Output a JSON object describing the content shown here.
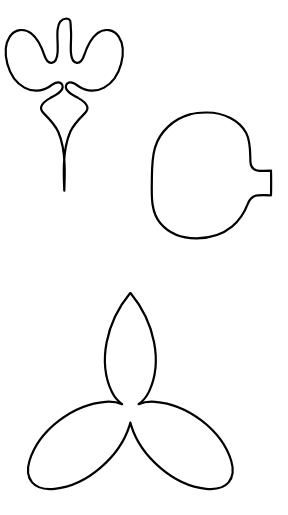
{
  "canvas": {
    "width": 288,
    "height": 515,
    "background_color": "#ffffff",
    "stroke_color": "#000000",
    "fill_color": "#ffffff",
    "description": "Three black-outline line-art shapes on a plain white background: a fleur-de-lis / iris bud silhouette at top-left, a notched leaf or pod silhouette at middle-right, and a three-petal trillium flower silhouette at the bottom."
  },
  "shapes": [
    {
      "id": "shape-1",
      "name": "fleur-de-lis-outline",
      "label": "Fleur-de-lis / iris bud outline",
      "position": "top-left",
      "bbox": {
        "x": 5,
        "y": 16,
        "width": 122,
        "height": 176
      },
      "stroke_width": 2.2,
      "path": "M 66.5 18.5 C 61.2 18.8 58.2 23.4 57.6 29.6 C 56.9 37.2 58.1 45.0 57.6 52.4 C 57.2 58.4 55.0 62.6 51.6 62.9 C 48.0 63.2 45.8 59.6 44.4 55.4 C 41.6 47.0 38.0 38.6 31.2 33.4 C 24.0 27.8 14.6 29.4 9.8 36.6 C 4.6 44.4 5.0 55.0 7.4 64.0 C 10.0 73.8 15.8 82.8 24.4 87.6 C 32.0 91.9 41.5 91.7 48.8 87.0 C 52.2 84.8 55.6 81.6 59.6 82.6 C 62.8 83.4 63.4 87.0 61.8 89.6 C 59.4 93.6 54.6 95.6 50.6 97.8 C 46.8 99.9 42.4 102.3 41.2 106.8 C 40.5 109.5 42.0 111.6 43.8 113.4 C 49.2 118.8 55.0 124.6 58.2 131.8 C 62.8 142.2 64.2 153.6 64.6 164.8 C 64.9 173.4 64.6 182.0 64.3 190.6 C 63.9 182.0 63.6 173.4 63.9 164.8 C 64.3 153.6 65.7 142.2 70.3 131.8 C 73.5 124.6 79.3 118.8 84.7 113.4 C 86.5 111.6 88.0 109.5 87.3 106.8 C 86.1 102.3 81.7 99.9 77.9 97.8 C 73.9 95.6 69.1 93.6 66.7 89.6 C 65.1 87.0 65.7 83.4 68.9 82.6 C 72.9 81.6 76.3 84.8 79.7 87.0 C 87.0 91.7 96.5 91.9 104.1 87.6 C 112.7 82.8 118.5 73.8 121.1 64.0 C 123.5 55.0 123.9 44.4 118.7 36.6 C 113.9 29.4 104.5 27.8 97.3 33.4 C 90.5 38.6 86.9 47.0 84.1 55.4 C 82.7 59.6 80.5 63.2 76.9 62.9 C 73.5 62.6 71.3 58.4 70.9 52.4 C 70.4 45.0 71.6 37.2 70.9 29.6 C 70.3 23.4 71.8 18.8 66.5 18.5 Z"
    },
    {
      "id": "shape-2",
      "name": "notched-leaf-outline",
      "label": "Notched leaf / pod outline with stem tab",
      "position": "middle-right",
      "bbox": {
        "x": 151,
        "y": 111,
        "width": 124,
        "height": 128
      },
      "stroke_width": 2.2,
      "path": "M 206.0 112.5 C 224.0 112.2 239.6 120.5 246.2 133.0 C 250.8 141.8 250.0 152.0 250.4 161.6 C 250.7 167.4 253.6 170.6 259.6 170.8 C 263.4 170.9 267.2 170.8 271.0 170.7 C 271.2 178.9 271.2 187.1 271.0 195.3 C 266.6 195.2 262.2 195.1 257.8 195.3 C 252.6 195.6 249.8 198.8 248.0 203.4 C 244.6 212.2 239.6 220.4 232.0 226.6 C 222.2 234.6 209.4 238.2 196.8 238.3 C 183.0 238.4 169.2 233.6 160.4 223.2 C 151.4 212.6 151.6 198.0 151.8 184.8 C 152.0 172.4 151.4 159.6 155.0 147.6 C 159.8 131.6 173.6 118.8 190.0 114.4 C 195.2 113.0 200.6 112.6 206.0 112.5 Z"
    },
    {
      "id": "shape-3",
      "name": "trillium-three-petal-outline",
      "label": "Three-petal trillium flower outline",
      "position": "bottom-center",
      "bbox": {
        "x": 37,
        "y": 292,
        "width": 196,
        "height": 199
      },
      "stroke_width": 2.2,
      "center": {
        "x": 130,
        "y": 400
      },
      "path": "M 130.5 293.0 C 142.0 307.0 150.5 324.0 154.0 342.0 C 157.2 358.4 156.2 376.4 149.0 391.6 C 146.6 396.6 143.2 401.0 138.6 404.2 C 143.8 402.0 149.4 401.4 155.0 401.8 C 172.0 403.0 188.0 410.2 201.4 420.4 C 215.0 430.8 226.2 444.4 231.2 460.8 C 233.4 468.0 233.6 476.4 228.6 482.4 C 223.2 488.8 214.0 489.6 206.0 488.8 C 189.0 487.0 173.2 478.8 160.4 467.8 C 147.2 456.6 136.4 442.2 131.2 425.6 C 130.9 424.6 130.6 423.6 130.4 422.6 C 130.1 423.6 129.8 424.6 129.5 425.6 C 124.3 442.2 113.5 456.6 100.3 467.8 C 87.5 478.8 71.7 487.0 54.7 488.8 C 46.7 489.6 37.5 488.8 32.1 482.4 C 27.1 476.4 27.3 468.0 29.5 460.8 C 34.5 444.4 45.7 430.8 59.3 420.4 C 72.7 410.2 88.7 403.0 105.7 401.8 C 111.3 401.4 116.9 402.0 122.1 404.2 C 117.5 401.0 114.1 396.6 111.7 391.6 C 104.5 376.4 103.5 358.4 106.7 342.0 C 110.2 324.0 118.7 307.0 130.2 293.0 Z"
    }
  ]
}
